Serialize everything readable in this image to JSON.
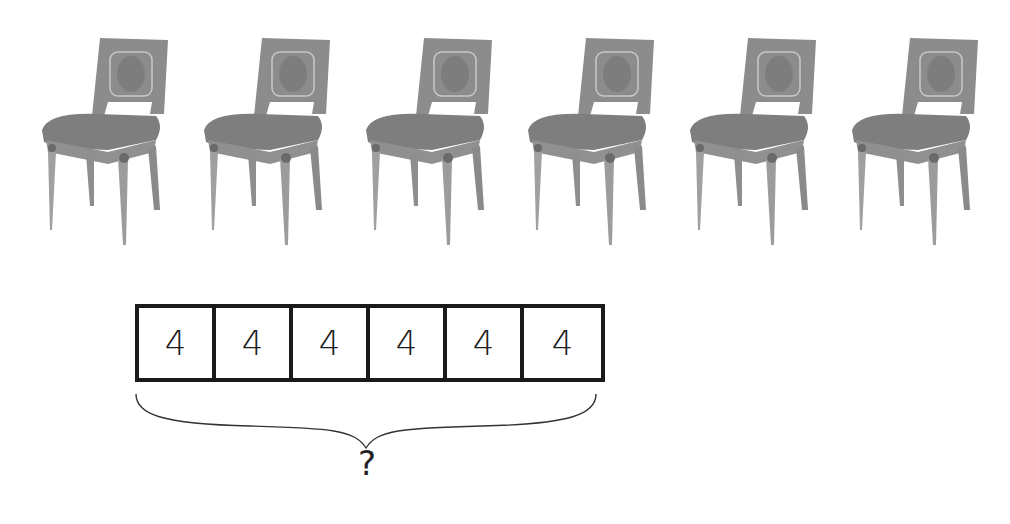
{
  "diagram": {
    "type": "multiplication-tape-diagram",
    "chairs": {
      "count": 6,
      "icon": "chair-icon",
      "positions_x": [
        38,
        200,
        362,
        524,
        686,
        848
      ]
    },
    "tape": {
      "cells": [
        {
          "value": "4"
        },
        {
          "value": "4"
        },
        {
          "value": "4"
        },
        {
          "value": "4"
        },
        {
          "value": "4"
        },
        {
          "value": "4"
        }
      ]
    },
    "total_label": "?",
    "colors": {
      "chair_fill": "#8a8a8a",
      "chair_dark": "#6f6f6f",
      "chair_light": "#a8a8a8",
      "box_border": "#1a1a1a",
      "text": "#1c1c1c"
    }
  }
}
